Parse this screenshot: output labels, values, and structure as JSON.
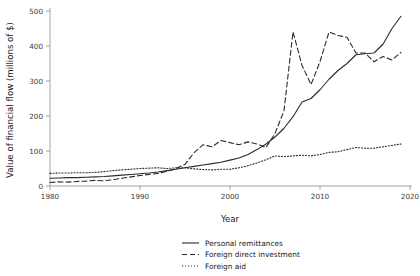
{
  "chart_data": {
    "type": "line",
    "title": "",
    "xlabel": "Year",
    "ylabel": "Value of financial flow (millions of $)",
    "xlim": [
      1978,
      2021
    ],
    "ylim": [
      0,
      520
    ],
    "xticks": [
      1980,
      1990,
      2000,
      2010,
      2020
    ],
    "yticks": [
      0,
      100,
      200,
      300,
      400,
      500
    ],
    "xtick_labels": [
      "1980",
      "1990",
      "2000",
      "2010",
      "2020"
    ],
    "ytick_labels": [
      "0",
      "100",
      "200",
      "300",
      "400",
      "500"
    ],
    "grid": false,
    "legend_position": "below-center",
    "x": [
      1980,
      1981,
      1982,
      1983,
      1984,
      1985,
      1986,
      1987,
      1988,
      1989,
      1990,
      1991,
      1992,
      1993,
      1994,
      1995,
      1996,
      1997,
      1998,
      1999,
      2000,
      2001,
      2002,
      2003,
      2004,
      2005,
      2006,
      2007,
      2008,
      2009,
      2010,
      2011,
      2012,
      2013,
      2014,
      2015,
      2016,
      2017,
      2018,
      2019
    ],
    "series": [
      {
        "name": "Personal remittances",
        "style": "solid",
        "color": "#2b2b2b",
        "values": [
          22,
          23,
          24,
          24,
          25,
          26,
          27,
          29,
          31,
          33,
          35,
          37,
          40,
          44,
          48,
          52,
          56,
          60,
          64,
          68,
          74,
          80,
          90,
          104,
          120,
          140,
          165,
          198,
          240,
          250,
          275,
          305,
          330,
          350,
          375,
          378,
          380,
          405,
          450,
          485
        ]
      },
      {
        "name": "Foreign direct investment",
        "style": "dashed",
        "color": "#2b2b2b",
        "values": [
          10,
          12,
          11,
          13,
          14,
          16,
          15,
          18,
          22,
          26,
          30,
          33,
          36,
          42,
          50,
          62,
          95,
          118,
          112,
          130,
          124,
          118,
          126,
          120,
          110,
          150,
          215,
          440,
          345,
          290,
          355,
          440,
          430,
          425,
          380,
          380,
          355,
          370,
          360,
          382
        ]
      },
      {
        "name": "Foreign aid",
        "style": "dotted",
        "color": "#2b2b2b",
        "values": [
          36,
          37,
          37,
          38,
          38,
          39,
          41,
          44,
          46,
          48,
          50,
          51,
          52,
          50,
          52,
          52,
          49,
          47,
          46,
          48,
          48,
          52,
          58,
          66,
          75,
          86,
          84,
          86,
          88,
          86,
          90,
          96,
          98,
          104,
          110,
          108,
          108,
          112,
          116,
          120
        ]
      }
    ]
  },
  "legend": {
    "items": [
      {
        "label": "Personal remittances",
        "style": "solid"
      },
      {
        "label": "Foreign direct investment",
        "style": "dashed"
      },
      {
        "label": "Foreign aid",
        "style": "dotted"
      }
    ]
  }
}
